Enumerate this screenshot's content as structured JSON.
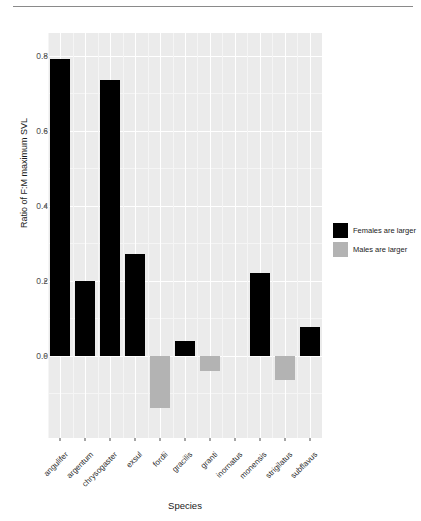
{
  "chart_data": {
    "type": "bar",
    "title": "",
    "xlabel": "Species",
    "ylabel": "Ratio of F:M maximum SVL",
    "ylim": [
      -0.22,
      0.86
    ],
    "yticks": [
      0.0,
      0.2,
      0.4,
      0.6,
      0.8
    ],
    "ytick_labels": [
      "0.0",
      "0.2",
      "0.4",
      "0.6",
      "0.8"
    ],
    "grid": true,
    "legend_position": "right",
    "categories": [
      "angulifer",
      "argentum",
      "chrysogaster",
      "exsul",
      "fordii",
      "gracilis",
      "granti",
      "inornatus",
      "monensis",
      "strigilatus",
      "subflavus"
    ],
    "values": [
      0.79,
      0.2,
      0.735,
      0.27,
      -0.14,
      0.04,
      -0.04,
      0.0,
      0.22,
      -0.065,
      0.075
    ],
    "series": [
      {
        "name": "Females are larger",
        "color": "#000000"
      },
      {
        "name": "Males are larger",
        "color": "#b3b3b3"
      }
    ],
    "legend": [
      {
        "label": "Females are larger",
        "color": "#000000"
      },
      {
        "label": "Males are larger",
        "color": "#b3b3b3"
      }
    ],
    "panel_background": "#ebebeb",
    "gridline_color": "#ffffff"
  },
  "axis": {
    "y_title": "Ratio of F:M maximum SVL",
    "x_title": "Species"
  }
}
